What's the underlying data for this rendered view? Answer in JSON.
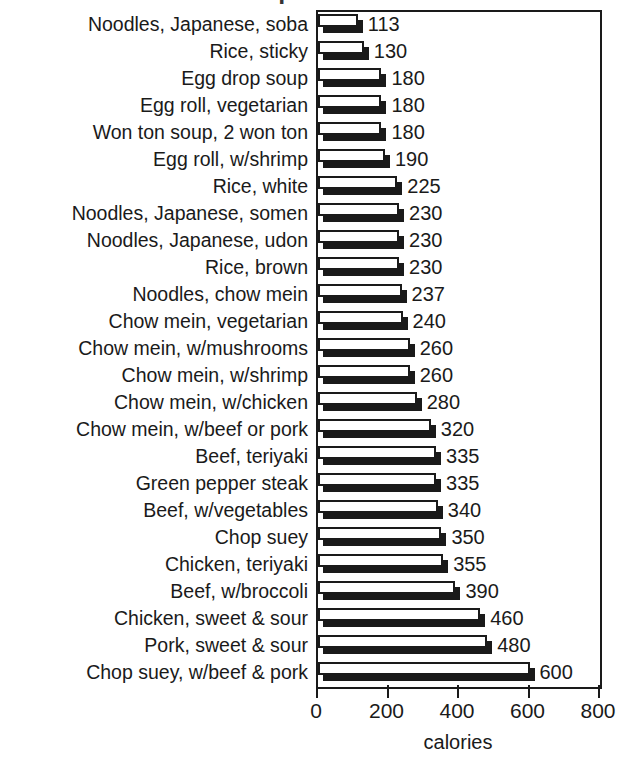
{
  "chart_data": {
    "type": "bar",
    "orientation": "horizontal",
    "title": "Chinese and Japanese Food Calories",
    "title_visible": false,
    "xlabel": "calories",
    "ylabel": "",
    "xlim": [
      0,
      800
    ],
    "xticks": [
      0,
      200,
      400,
      600,
      800
    ],
    "xtick_labels": [
      "0",
      "200",
      "400",
      "600",
      "800"
    ],
    "grid": false,
    "legend": false,
    "bar_style": "white-fill-black-outline-with-drop-shadow",
    "value_labels_shown": true,
    "categories": [
      "Noodles, Japanese, soba",
      "Rice, sticky",
      "Egg drop soup",
      "Egg roll, vegetarian",
      "Won ton soup, 2 won ton",
      "Egg roll, w/shrimp",
      "Rice, white",
      "Noodles, Japanese, somen",
      "Noodles, Japanese, udon",
      "Rice, brown",
      "Noodles, chow mein",
      "Chow mein, vegetarian",
      "Chow mein, w/mushrooms",
      "Chow mein, w/shrimp",
      "Chow mein, w/chicken",
      "Chow mein, w/beef or pork",
      "Beef, teriyaki",
      "Green pepper steak",
      "Beef, w/vegetables",
      "Chop suey",
      "Chicken, teriyaki",
      "Beef, w/broccoli",
      "Chicken, sweet & sour",
      "Pork, sweet & sour",
      "Chop suey, w/beef & pork"
    ],
    "values": [
      113,
      130,
      180,
      180,
      180,
      190,
      225,
      230,
      230,
      230,
      237,
      240,
      260,
      260,
      280,
      320,
      335,
      335,
      340,
      350,
      355,
      390,
      460,
      480,
      600
    ],
    "value_label_texts": [
      "113",
      "130",
      "180",
      "180",
      "180",
      "190",
      "225",
      "230",
      "230",
      "230",
      "237",
      "240",
      "260",
      "260",
      "280",
      "320",
      "335",
      "335",
      "340",
      "350",
      "355",
      "390",
      "460",
      "480",
      "600"
    ]
  },
  "colors": {
    "ink": "#1a1a1a",
    "background": "#ffffff",
    "bar_fill": "#ffffff",
    "bar_shadow": "#1a1a1a"
  }
}
